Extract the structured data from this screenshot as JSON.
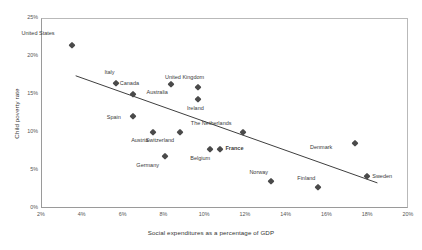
{
  "chart_data": {
    "type": "scatter",
    "title": "",
    "xlabel": "Social expenditures as a percentage of GDP",
    "ylabel": "Child poverty rate",
    "xlim": [
      2,
      20
    ],
    "ylim": [
      0,
      25
    ],
    "xticks": [
      "2%",
      "4%",
      "6%",
      "8%",
      "10%",
      "12%",
      "14%",
      "16%",
      "18%",
      "20%"
    ],
    "xtick_values": [
      2,
      4,
      6,
      8,
      10,
      12,
      14,
      16,
      18,
      20
    ],
    "yticks": [
      "0%",
      "5%",
      "10%",
      "15%",
      "20%",
      "25%"
    ],
    "ytick_values": [
      0,
      5,
      10,
      15,
      20,
      25
    ],
    "grid": false,
    "legend": "none",
    "marker": "diamond",
    "marker_color": "#4a4a4a",
    "points": [
      {
        "label": "United States",
        "x": 3.5,
        "y": 21.5,
        "lx": -25,
        "ly": -11,
        "bold": false
      },
      {
        "label": "Italy",
        "x": 5.7,
        "y": 16.5,
        "lx": -10,
        "ly": -10,
        "bold": false
      },
      {
        "label": "Canada",
        "x": 6.5,
        "y": 15.0,
        "lx": -2,
        "ly": -10,
        "bold": false
      },
      {
        "label": "Australia",
        "x": 8.4,
        "y": 16.3,
        "lx": -12,
        "ly": 9,
        "bold": false
      },
      {
        "label": "United Kingdom",
        "x": 9.7,
        "y": 15.9,
        "lx": -2,
        "ly": -9,
        "bold": false
      },
      {
        "label": "Ireland",
        "x": 9.7,
        "y": 14.4,
        "lx": -2,
        "ly": 10,
        "bold": false
      },
      {
        "label": "Spain",
        "x": 6.5,
        "y": 12.1,
        "lx": -20,
        "ly": 2,
        "bold": false
      },
      {
        "label": "Austria",
        "x": 7.5,
        "y": 10.0,
        "lx": -13,
        "ly": 9,
        "bold": false
      },
      {
        "label": "Switzerland",
        "x": 8.8,
        "y": 10.0,
        "lx": -14,
        "ly": 9,
        "bold": false
      },
      {
        "label": "The Netherlands",
        "x": 11.9,
        "y": 10.0,
        "lx": -19,
        "ly": -8,
        "bold": false
      },
      {
        "label": "Germany",
        "x": 8.1,
        "y": 6.8,
        "lx": -14,
        "ly": 10,
        "bold": false
      },
      {
        "label": "Belgium",
        "x": 10.3,
        "y": 7.7,
        "lx": -8,
        "ly": 10,
        "bold": false
      },
      {
        "label": "France",
        "x": 10.8,
        "y": 7.7,
        "lx": 5,
        "ly": 0,
        "bold": true
      },
      {
        "label": "Denmark",
        "x": 17.4,
        "y": 8.5,
        "lx": -31,
        "ly": 5,
        "bold": false
      },
      {
        "label": "Sweden",
        "x": 18.0,
        "y": 4.2,
        "lx": 5,
        "ly": 1,
        "bold": false
      },
      {
        "label": "Norway",
        "x": 13.3,
        "y": 3.6,
        "lx": -11,
        "ly": -8,
        "bold": false
      },
      {
        "label": "Finland",
        "x": 15.6,
        "y": 2.7,
        "lx": -11,
        "ly": -8,
        "bold": false
      }
    ],
    "trendline": {
      "x_start": 3.7,
      "y_start": 17.4,
      "x_end": 18.5,
      "y_end": 3.3,
      "color": "#3f3f3f"
    }
  }
}
